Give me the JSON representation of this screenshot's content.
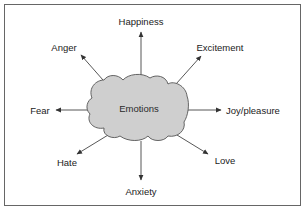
{
  "diagram": {
    "center": {
      "label": "Emotions",
      "shape": "cloud",
      "fill": "#cfcfcf",
      "stroke": "#555555"
    },
    "branches": [
      {
        "label": "Happiness",
        "direction": "up"
      },
      {
        "label": "Excitement",
        "direction": "up-right"
      },
      {
        "label": "Joy/pleasure",
        "direction": "right"
      },
      {
        "label": "Love",
        "direction": "down-right"
      },
      {
        "label": "Anxiety",
        "direction": "down"
      },
      {
        "label": "Hate",
        "direction": "down-left"
      },
      {
        "label": "Fear",
        "direction": "left"
      },
      {
        "label": "Anger",
        "direction": "up-left"
      }
    ],
    "colors": {
      "border": "#555555",
      "arrow": "#333333",
      "text": "#222222",
      "background": "#ffffff"
    }
  }
}
